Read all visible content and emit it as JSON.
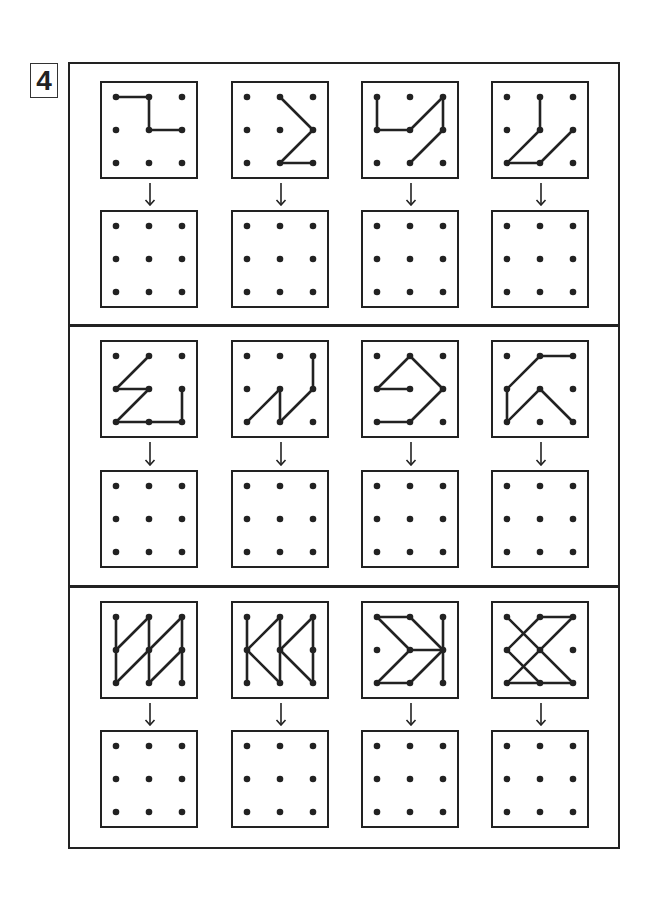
{
  "exercise": {
    "number": "4",
    "instructions_visible": false
  },
  "layout": {
    "columns_x": [
      101,
      232,
      362,
      492
    ],
    "rows": [
      {
        "pattern_y": 82,
        "answer_y": 211
      },
      {
        "pattern_y": 341,
        "answer_y": 471
      },
      {
        "pattern_y": 602,
        "answer_y": 731
      }
    ],
    "box_size": 96,
    "dividers_y": [
      324,
      585
    ]
  },
  "colors": {
    "line": "#222222",
    "dot": "#222222",
    "background": "#ffffff"
  },
  "grid": {
    "dots_per_side": 3
  },
  "patterns": [
    [
      {
        "segments": [
          [
            [
              0,
              0
            ],
            [
              1,
              0
            ]
          ],
          [
            [
              1,
              0
            ],
            [
              1,
              1
            ]
          ],
          [
            [
              1,
              1
            ],
            [
              2,
              1
            ]
          ]
        ]
      },
      {
        "segments": [
          [
            [
              1,
              0
            ],
            [
              2,
              1
            ]
          ],
          [
            [
              2,
              1
            ],
            [
              1,
              2
            ]
          ],
          [
            [
              1,
              2
            ],
            [
              2,
              2
            ]
          ]
        ]
      },
      {
        "segments": [
          [
            [
              0,
              0
            ],
            [
              0,
              1
            ]
          ],
          [
            [
              0,
              1
            ],
            [
              1,
              1
            ]
          ],
          [
            [
              1,
              1
            ],
            [
              2,
              0
            ]
          ],
          [
            [
              2,
              0
            ],
            [
              2,
              1
            ]
          ],
          [
            [
              2,
              1
            ],
            [
              1,
              2
            ]
          ]
        ]
      },
      {
        "segments": [
          [
            [
              1,
              0
            ],
            [
              1,
              1
            ]
          ],
          [
            [
              1,
              1
            ],
            [
              0,
              2
            ]
          ],
          [
            [
              0,
              2
            ],
            [
              1,
              2
            ]
          ],
          [
            [
              1,
              2
            ],
            [
              2,
              1
            ]
          ]
        ]
      }
    ],
    [
      {
        "segments": [
          [
            [
              1,
              0
            ],
            [
              0,
              1
            ]
          ],
          [
            [
              0,
              1
            ],
            [
              1,
              1
            ]
          ],
          [
            [
              1,
              1
            ],
            [
              0,
              2
            ]
          ],
          [
            [
              0,
              2
            ],
            [
              1,
              2
            ]
          ],
          [
            [
              1,
              2
            ],
            [
              2,
              2
            ]
          ],
          [
            [
              2,
              2
            ],
            [
              2,
              1
            ]
          ]
        ]
      },
      {
        "segments": [
          [
            [
              2,
              0
            ],
            [
              2,
              1
            ]
          ],
          [
            [
              2,
              1
            ],
            [
              1,
              2
            ]
          ],
          [
            [
              1,
              2
            ],
            [
              1,
              1
            ]
          ],
          [
            [
              1,
              1
            ],
            [
              0,
              2
            ]
          ]
        ]
      },
      {
        "segments": [
          [
            [
              1,
              1
            ],
            [
              0,
              1
            ]
          ],
          [
            [
              0,
              1
            ],
            [
              1,
              0
            ]
          ],
          [
            [
              1,
              0
            ],
            [
              2,
              1
            ]
          ],
          [
            [
              2,
              1
            ],
            [
              1,
              2
            ]
          ],
          [
            [
              1,
              2
            ],
            [
              0,
              2
            ]
          ]
        ]
      },
      {
        "segments": [
          [
            [
              2,
              0
            ],
            [
              1,
              0
            ]
          ],
          [
            [
              1,
              0
            ],
            [
              0,
              1
            ]
          ],
          [
            [
              0,
              1
            ],
            [
              0,
              2
            ]
          ],
          [
            [
              0,
              2
            ],
            [
              1,
              1
            ]
          ],
          [
            [
              1,
              1
            ],
            [
              2,
              2
            ]
          ]
        ]
      }
    ],
    [
      {
        "segments": [
          [
            [
              0,
              0
            ],
            [
              0,
              2
            ]
          ],
          [
            [
              1,
              0
            ],
            [
              1,
              2
            ]
          ],
          [
            [
              2,
              0
            ],
            [
              2,
              2
            ]
          ],
          [
            [
              0,
              1
            ],
            [
              1,
              0
            ]
          ],
          [
            [
              0,
              2
            ],
            [
              2,
              0
            ]
          ],
          [
            [
              1,
              2
            ],
            [
              2,
              1
            ]
          ]
        ]
      },
      {
        "segments": [
          [
            [
              0,
              0
            ],
            [
              0,
              2
            ]
          ],
          [
            [
              1,
              0
            ],
            [
              1,
              2
            ]
          ],
          [
            [
              2,
              0
            ],
            [
              2,
              2
            ]
          ],
          [
            [
              0,
              1
            ],
            [
              1,
              0
            ]
          ],
          [
            [
              0,
              1
            ],
            [
              1,
              2
            ]
          ],
          [
            [
              1,
              1
            ],
            [
              2,
              0
            ]
          ],
          [
            [
              1,
              1
            ],
            [
              2,
              2
            ]
          ]
        ]
      },
      {
        "segments": [
          [
            [
              0,
              0
            ],
            [
              1,
              0
            ]
          ],
          [
            [
              0,
              0
            ],
            [
              1,
              1
            ]
          ],
          [
            [
              1,
              0
            ],
            [
              2,
              1
            ]
          ],
          [
            [
              1,
              1
            ],
            [
              2,
              1
            ]
          ],
          [
            [
              0,
              2
            ],
            [
              1,
              1
            ]
          ],
          [
            [
              0,
              2
            ],
            [
              1,
              2
            ]
          ],
          [
            [
              1,
              2
            ],
            [
              2,
              1
            ]
          ],
          [
            [
              2,
              0
            ],
            [
              2,
              2
            ]
          ]
        ]
      },
      {
        "segments": [
          [
            [
              1,
              0
            ],
            [
              2,
              0
            ]
          ],
          [
            [
              0,
              0
            ],
            [
              2,
              2
            ]
          ],
          [
            [
              1,
              0
            ],
            [
              0,
              1
            ]
          ],
          [
            [
              0,
              1
            ],
            [
              1,
              2
            ]
          ],
          [
            [
              2,
              0
            ],
            [
              0,
              2
            ]
          ],
          [
            [
              0,
              2
            ],
            [
              2,
              2
            ]
          ]
        ]
      }
    ]
  ]
}
